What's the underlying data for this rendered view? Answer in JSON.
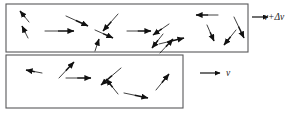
{
  "figure": {
    "background_color": "#ffffff",
    "line_color": "#58585a",
    "arrow_color": "#111111",
    "width": 298,
    "height": 115
  },
  "boxes": [
    {
      "name": "upper-control-volume",
      "x": 6,
      "y": 4,
      "width": 242,
      "height": 48
    },
    {
      "name": "lower-control-volume",
      "x": 6,
      "y": 55,
      "width": 177,
      "height": 53
    }
  ],
  "flow_labels": [
    {
      "id": "upper",
      "text": "v+Δv",
      "x": 274,
      "y": 20,
      "arrow_x1": 252,
      "arrow_y1": 17,
      "arrow_x2": 268,
      "arrow_y2": 17
    },
    {
      "id": "lower",
      "text": "v",
      "x": 228,
      "y": 76,
      "arrow_x1": 200,
      "arrow_y1": 73,
      "arrow_x2": 220,
      "arrow_y2": 73
    }
  ],
  "upper_box_vectors": [
    {
      "x1": 29,
      "y1": 22,
      "x2": 20,
      "y2": 11
    },
    {
      "x1": 28,
      "y1": 38,
      "x2": 22,
      "y2": 26
    },
    {
      "x1": 45,
      "y1": 31,
      "x2": 74,
      "y2": 31
    },
    {
      "x1": 66,
      "y1": 16,
      "x2": 88,
      "y2": 26
    },
    {
      "x1": 118,
      "y1": 14,
      "x2": 103,
      "y2": 31
    },
    {
      "x1": 95,
      "y1": 30,
      "x2": 113,
      "y2": 38
    },
    {
      "x1": 95,
      "y1": 51,
      "x2": 99,
      "y2": 39
    },
    {
      "x1": 127,
      "y1": 31,
      "x2": 151,
      "y2": 31
    },
    {
      "x1": 169,
      "y1": 24,
      "x2": 153,
      "y2": 35
    },
    {
      "x1": 160,
      "y1": 53,
      "x2": 173,
      "y2": 39
    },
    {
      "x1": 163,
      "y1": 34,
      "x2": 152,
      "y2": 48
    },
    {
      "x1": 159,
      "y1": 44,
      "x2": 184,
      "y2": 38
    },
    {
      "x1": 218,
      "y1": 15,
      "x2": 196,
      "y2": 15
    },
    {
      "x1": 207,
      "y1": 25,
      "x2": 214,
      "y2": 41
    },
    {
      "x1": 236,
      "y1": 30,
      "x2": 224,
      "y2": 45
    },
    {
      "x1": 234,
      "y1": 17,
      "x2": 244,
      "y2": 38
    }
  ],
  "lower_box_vectors": [
    {
      "x1": 42,
      "y1": 73,
      "x2": 26,
      "y2": 70
    },
    {
      "x1": 59,
      "y1": 78,
      "x2": 74,
      "y2": 62
    },
    {
      "x1": 66,
      "y1": 78,
      "x2": 91,
      "y2": 78
    },
    {
      "x1": 121,
      "y1": 68,
      "x2": 101,
      "y2": 85
    },
    {
      "x1": 118,
      "y1": 94,
      "x2": 106,
      "y2": 79
    },
    {
      "x1": 124,
      "y1": 93,
      "x2": 148,
      "y2": 98
    },
    {
      "x1": 156,
      "y1": 90,
      "x2": 169,
      "y2": 74
    }
  ]
}
